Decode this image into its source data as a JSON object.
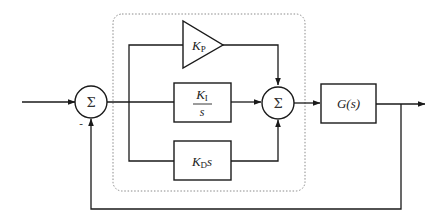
{
  "diagram": {
    "controller_region": {
      "style": "dotted rounded rectangle"
    },
    "summing_junctions": [
      {
        "id": "sum-error",
        "symbol": "Σ",
        "feedback_sign": "-"
      },
      {
        "id": "sum-pid",
        "symbol": "Σ"
      }
    ],
    "blocks": {
      "proportional": {
        "K": "K",
        "sub": "P"
      },
      "integral": {
        "num_K": "K",
        "num_sub": "I",
        "den": "s"
      },
      "derivative": {
        "K": "K",
        "sub": "D",
        "var": "s"
      },
      "plant": {
        "label": "G(s)"
      }
    },
    "colors": {
      "line": "#1a1a1a",
      "dotted_border": "#8a8a8a",
      "background": "#ffffff"
    }
  }
}
